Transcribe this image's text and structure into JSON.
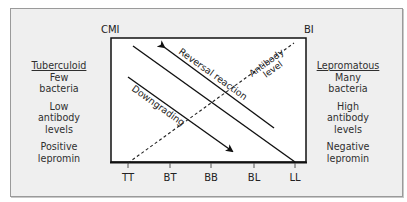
{
  "diagram": {
    "axis_left_label": "CMI",
    "axis_right_label": "BI",
    "spectrum": [
      "TT",
      "BT",
      "BB",
      "BL",
      "LL"
    ],
    "annotations": {
      "reversal": "Reversal reaction",
      "downgrading": "Downgrading",
      "antibody_1": "Antibody",
      "antibody_2": "level"
    }
  },
  "left": {
    "heading": "Tuberculoid",
    "lines": [
      "Few",
      "bacteria",
      "Low",
      "antibody",
      "levels",
      "Positive",
      "lepromin"
    ]
  },
  "right": {
    "heading": "Lepromatous",
    "lines": [
      "Many",
      "bacteria",
      "High",
      "antibody",
      "levels",
      "Negative",
      "lepromin"
    ]
  }
}
